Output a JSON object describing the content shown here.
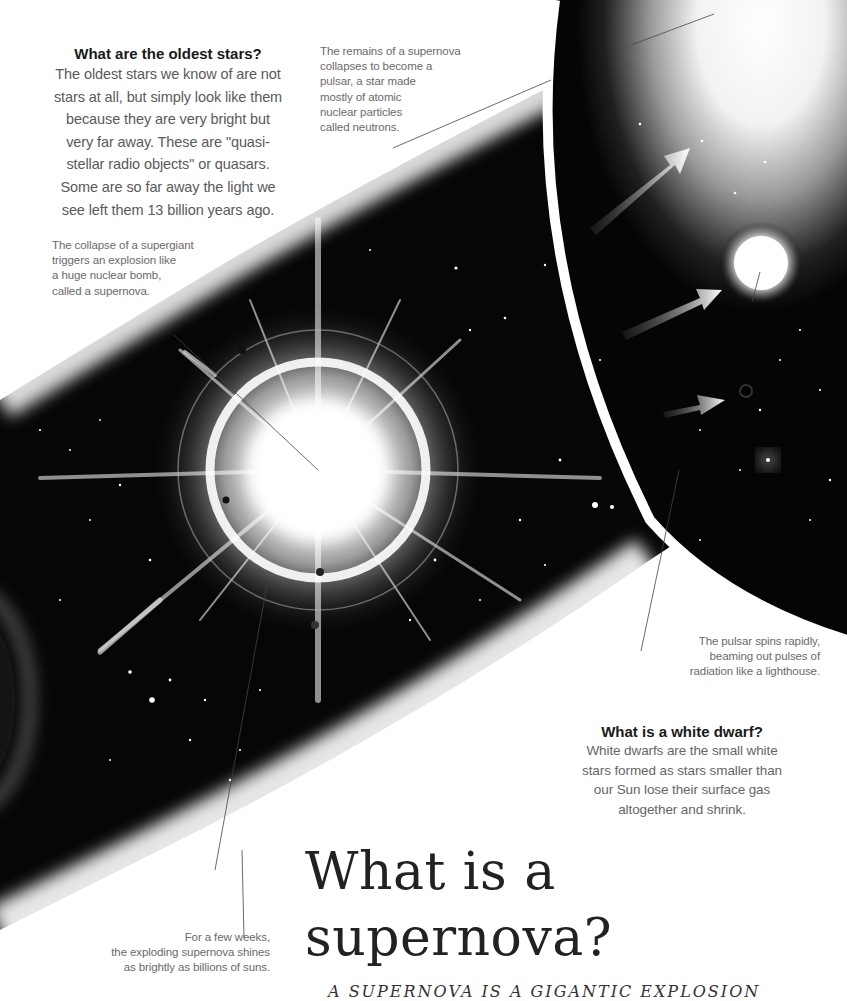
{
  "oldest_stars": {
    "heading": "What are the oldest stars?",
    "lines": [
      "The oldest stars we know of are not",
      "stars at all, but simply look like them",
      "because they are very bright but",
      "very far away. These are \"quasi-",
      "stellar radio objects\" or quasars.",
      "Some are so far away the light we",
      "see left them 13 billion years ago."
    ]
  },
  "captions": {
    "pulsar_remains": [
      "The remains of a supernova",
      "collapses to become a",
      "pulsar, a star made",
      "mostly of atomic",
      "nuclear particles",
      "called neutrons."
    ],
    "supergiant": [
      "The collapse of a supergiant",
      "triggers an explosion like",
      "a huge nuclear bomb,",
      "called a supernova."
    ],
    "pulsar_spins": [
      "The pulsar spins rapidly,",
      "beaming out pulses of",
      "radiation like a lighthouse."
    ],
    "few_weeks": [
      "For a few weeks,",
      "the exploding supernova shines",
      "as brightly as billions of suns."
    ]
  },
  "white_dwarf": {
    "heading": "What is a white dwarf?",
    "lines": [
      "White dwarfs are the small white",
      "stars formed as stars smaller than",
      "our Sun lose their surface gas",
      "altogether and shrink."
    ]
  },
  "title": {
    "line1": "What is a",
    "line2": "supernova?"
  },
  "subhead": "A SUPERNOVA IS A GIGANTIC EXPLOSION",
  "illustration": {
    "elements": [
      "supernova-explosion",
      "space-band",
      "pulsar-inset",
      "neutron-star",
      "radiation-arrows",
      "black-hole-dot",
      "nebula-ring"
    ],
    "colors": {
      "space": "#050505",
      "glow": "#ffffff",
      "page": "#ffffff",
      "text": "#5a5a5a",
      "heading": "#1a1a1a"
    }
  }
}
